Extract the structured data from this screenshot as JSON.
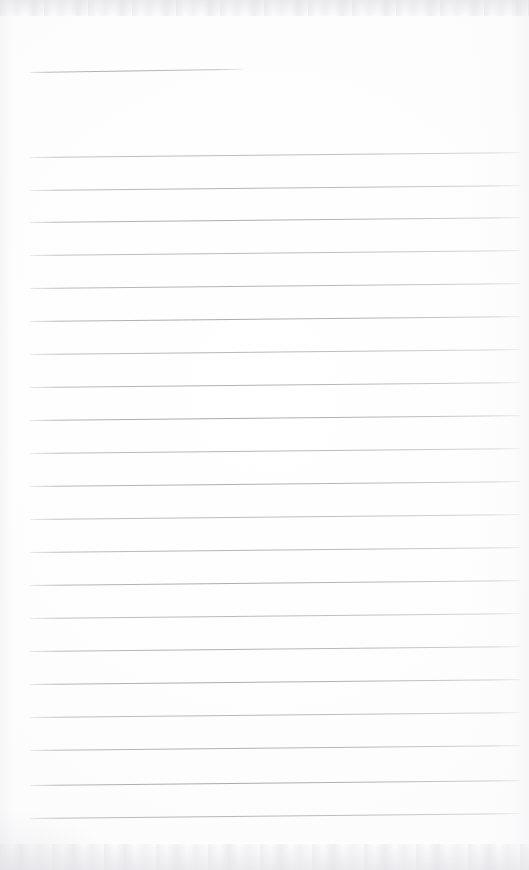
{
  "document": {
    "kind": "scanned-ruled-notebook-page",
    "title": "",
    "page_text": "",
    "is_blank": true,
    "width": 529,
    "height": 870
  },
  "paper": {
    "background_color": "#fefefe",
    "base_tone": "#fdfdfd",
    "edge_noise_color": "#e6e6ea",
    "rule_color": "#acacb4",
    "rule_color_light": "#cdd0d4"
  },
  "ruling": {
    "style": "wide-ruled",
    "line_count": 21,
    "line_spacing_px": 33,
    "first_line_y": 157,
    "last_line_y": 818,
    "left_margin_x": 30,
    "right_end_x": 520,
    "slant_degrees": -0.58,
    "has_vertical_margin_rule": false
  },
  "title_rule": {
    "label": "short-top-rule",
    "x": 30,
    "y": 72,
    "length_px": 213,
    "slant_degrees": -0.9
  },
  "rules": [
    {
      "y": 157
    },
    {
      "y": 190
    },
    {
      "y": 222
    },
    {
      "y": 255
    },
    {
      "y": 288
    },
    {
      "y": 321
    },
    {
      "y": 354
    },
    {
      "y": 387
    },
    {
      "y": 420
    },
    {
      "y": 453
    },
    {
      "y": 486
    },
    {
      "y": 519
    },
    {
      "y": 552
    },
    {
      "y": 585
    },
    {
      "y": 618
    },
    {
      "y": 651
    },
    {
      "y": 684
    },
    {
      "y": 717
    },
    {
      "y": 750
    },
    {
      "y": 785
    },
    {
      "y": 818
    }
  ]
}
